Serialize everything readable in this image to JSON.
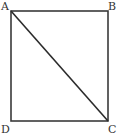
{
  "figure": {
    "background_color": "#ffffff",
    "stroke_color": "#3a3a3a",
    "diagonal_color": "#2b2b2b",
    "label_color": "#333333",
    "stroke_width": 1.6,
    "rectangle": {
      "name": "rectangle-abcd",
      "x": 11,
      "y": 11,
      "width": 97,
      "height": 110
    },
    "diagonal": {
      "name": "diagonal-a-c",
      "from": "A",
      "to": "C",
      "x1": 11,
      "y1": 11,
      "x2": 108,
      "y2": 121
    },
    "vertices": [
      {
        "id": "A",
        "label": "A",
        "x": 11,
        "y": 11,
        "position": "top-left"
      },
      {
        "id": "B",
        "label": "B",
        "x": 108,
        "y": 11,
        "position": "top-right"
      },
      {
        "id": "C",
        "label": "C",
        "x": 108,
        "y": 121,
        "position": "bottom-right"
      },
      {
        "id": "D",
        "label": "D",
        "x": 11,
        "y": 121,
        "position": "bottom-left"
      }
    ]
  }
}
